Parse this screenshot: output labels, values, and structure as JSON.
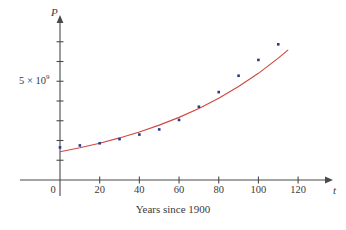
{
  "figure": {
    "caption": "Years since 1900",
    "y_axis_variable": "P",
    "x_axis_variable": "t",
    "y_tick_label_mantissa": "5 × 10",
    "y_tick_label_exponent": "9",
    "origin_label": "0",
    "colors": {
      "points": "#2b3a8f",
      "curve": "#d1483f",
      "axis": "#4a4a4a",
      "text": "#3a3a3a",
      "background": "#ffffff"
    }
  },
  "chart_data": {
    "type": "scatter",
    "title": "",
    "subtitle": "",
    "xlabel": "Years since 1900",
    "ylabel": "P",
    "x_axis_symbol": "t",
    "grid": false,
    "legend": "none",
    "xlim": [
      0,
      126
    ],
    "ylim": [
      0,
      8000000000
    ],
    "xticks": [
      0,
      20,
      40,
      60,
      80,
      100,
      120
    ],
    "xtick_labels": [
      "0",
      "20",
      "40",
      "60",
      "80",
      "100",
      "120"
    ],
    "yticks": [
      1000000000,
      2000000000,
      3000000000,
      4000000000,
      5000000000,
      6000000000,
      7000000000
    ],
    "ytick_labels": [
      "",
      "",
      "",
      "",
      "5 × 10⁹",
      "",
      ""
    ],
    "series": [
      {
        "name": "Population data",
        "type": "scatter",
        "marker": "square",
        "color": "#2b3a8f",
        "x": [
          0,
          10,
          20,
          30,
          40,
          50,
          60,
          70,
          80,
          90,
          100,
          110
        ],
        "y": [
          1650000000,
          1750000000,
          1860000000,
          2070000000,
          2300000000,
          2560000000,
          3040000000,
          3710000000,
          4450000000,
          5280000000,
          6080000000,
          6870000000
        ]
      },
      {
        "name": "Exponential model",
        "type": "line",
        "color": "#d1483f",
        "x": [
          0,
          10,
          20,
          30,
          40,
          50,
          60,
          70,
          80,
          90,
          100,
          110,
          115
        ],
        "y": [
          1430000000,
          1630000000,
          1860000000,
          2130000000,
          2430000000,
          2780000000,
          3170000000,
          3620000000,
          4140000000,
          4730000000,
          5400000000,
          6170000000,
          6590000000
        ]
      }
    ]
  }
}
